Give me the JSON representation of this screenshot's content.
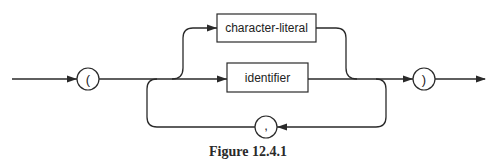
{
  "diagram": {
    "type": "railroad-syntax-diagram",
    "caption": "Figure 12.4.1",
    "terminals": {
      "open_paren": "(",
      "close_paren": ")",
      "comma": ","
    },
    "nonterminals": {
      "character_literal": "character-literal",
      "identifier": "identifier"
    },
    "colors": {
      "stroke": "#2a2a2a",
      "background": "#ffffff"
    }
  }
}
